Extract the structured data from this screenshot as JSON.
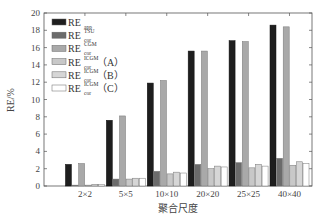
{
  "chart_data": {
    "type": "bar",
    "title": "",
    "xlabel": "聚合尺度",
    "ylabel": "RE/%",
    "ylim": [
      0,
      20
    ],
    "yticks": [
      0,
      2,
      4,
      6,
      8,
      10,
      12,
      14,
      16,
      18,
      20
    ],
    "grid": false,
    "legend_position": "upper-left",
    "categories": [
      "2×2",
      "5×5",
      "10×10",
      "20×20",
      "25×25",
      "40×40"
    ],
    "series": [
      {
        "name": "RE_app",
        "base": "RE",
        "sub": "app",
        "sup": "",
        "suffix": "",
        "color": "#1e1e1e",
        "values": [
          2.5,
          7.6,
          11.9,
          15.6,
          16.8,
          18.6
        ]
      },
      {
        "name": "RE_cor^TSU",
        "base": "RE",
        "sub": "cor",
        "sup": "TSU",
        "suffix": "",
        "color": "#6b6b6b",
        "values": [
          0.1,
          0.8,
          1.7,
          2.5,
          2.7,
          3.2
        ]
      },
      {
        "name": "RE_cor^CGM",
        "base": "RE",
        "sub": "cor",
        "sup": "CGM",
        "suffix": "",
        "color": "#a9a9a9",
        "values": [
          2.6,
          8.1,
          12.2,
          15.6,
          16.7,
          18.4
        ]
      },
      {
        "name": "RE_cor^ICGM (A)",
        "base": "RE",
        "sub": "cor",
        "sup": "ICGM",
        "suffix": "（A）",
        "color": "#c8c8c8",
        "values": [
          0.1,
          0.8,
          1.4,
          2.0,
          2.1,
          2.4
        ]
      },
      {
        "name": "RE_cor^ICGM (B)",
        "base": "RE",
        "sub": "cor",
        "sup": "ICGM",
        "suffix": "（B）",
        "color": "#d6d6d6",
        "values": [
          0.2,
          0.9,
          1.6,
          2.3,
          2.5,
          2.8
        ]
      },
      {
        "name": "RE_cor^ICGM (C)",
        "base": "RE",
        "sub": "cor",
        "sup": "ICGM",
        "suffix": "（C）",
        "color": "#ffffff",
        "values": [
          0.2,
          0.9,
          1.5,
          2.2,
          2.3,
          2.6
        ]
      }
    ]
  }
}
